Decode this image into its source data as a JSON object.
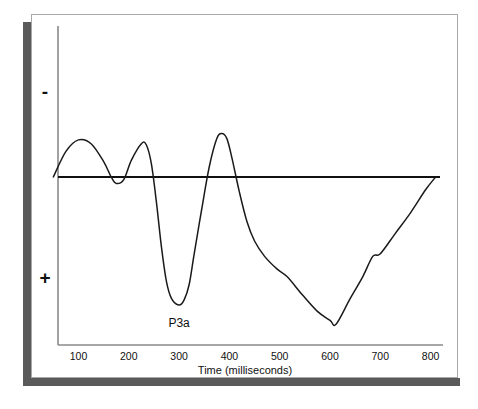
{
  "chart_data": {
    "type": "line",
    "title": "",
    "subtitle": "",
    "xlabel": "Time (milliseconds)",
    "ylabel": "",
    "xlim": [
      0,
      850
    ],
    "ylim": [
      -1.35,
      1.0
    ],
    "xticks": [
      100,
      200,
      300,
      400,
      500,
      600,
      700,
      800
    ],
    "xtick_labels": [
      "100",
      "200",
      "300",
      "400",
      "500",
      "600",
      "700",
      "800"
    ],
    "ytick_labels": [
      "-",
      "+"
    ],
    "y_axis_note": "Polarity axis: negative plotted upward, positive plotted downward (ERP convention)",
    "grid": false,
    "legend": false,
    "baseline_value": 0,
    "annotations": [
      {
        "text": "P3a",
        "x": 300,
        "y": -1.0,
        "description": "label for the large positive-going deflection peaking near 300 ms"
      }
    ],
    "series": [
      {
        "name": "ERP waveform",
        "color": "#1a1a1a",
        "x": [
          50,
          75,
          100,
          125,
          150,
          165,
          175,
          190,
          205,
          225,
          235,
          245,
          255,
          265,
          275,
          285,
          300,
          310,
          320,
          330,
          345,
          360,
          375,
          385,
          395,
          405,
          420,
          435,
          450,
          470,
          495,
          515,
          545,
          575,
          600,
          612,
          640,
          665,
          685,
          700,
          730,
          760,
          790,
          810
        ],
        "y": [
          0.0,
          0.2,
          0.29,
          0.26,
          0.12,
          0.0,
          -0.05,
          -0.02,
          0.13,
          0.26,
          0.25,
          0.1,
          -0.2,
          -0.55,
          -0.82,
          -0.95,
          -1.0,
          -0.96,
          -0.84,
          -0.6,
          -0.25,
          0.08,
          0.3,
          0.34,
          0.3,
          0.15,
          -0.12,
          -0.35,
          -0.5,
          -0.62,
          -0.72,
          -0.78,
          -0.92,
          -1.05,
          -1.12,
          -1.15,
          -0.95,
          -0.78,
          -0.62,
          -0.6,
          -0.44,
          -0.28,
          -0.1,
          0.0
        ]
      }
    ]
  },
  "axis": {
    "negative_symbol": "-",
    "positive_symbol": "+",
    "x_title": "Time (milliseconds)"
  },
  "annotation": {
    "p3a_label": "P3a"
  },
  "colors": {
    "waveform": "#1a1a1a",
    "baseline": "#111111",
    "axis": "#777777",
    "frame_border": "#a8a8a8",
    "shadow": "#5a5a5a",
    "background": "#ffffff"
  }
}
